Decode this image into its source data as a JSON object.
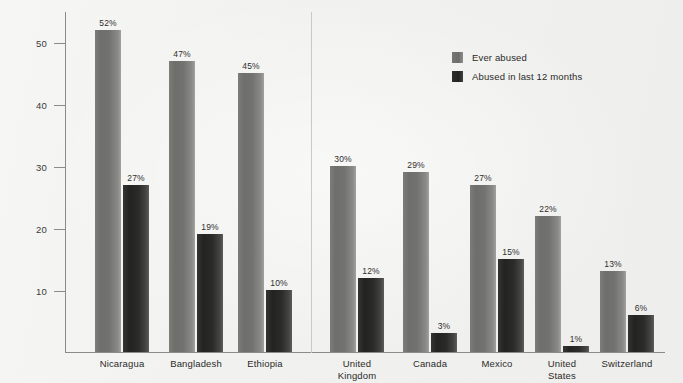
{
  "chart_data": {
    "type": "bar",
    "title": "",
    "xlabel": "",
    "ylabel": "Percentage of women",
    "ylim": [
      0,
      55
    ],
    "yticks": [
      10,
      20,
      30,
      40,
      50
    ],
    "ytick_labels": [
      "10",
      "20",
      "30",
      "40",
      "50"
    ],
    "grid": false,
    "legend_position": "top-right",
    "categories": [
      "Nicaragua",
      "Bangladesh",
      "Ethiopia",
      "United\nKingdom",
      "Canada",
      "Mexico",
      "United\nStates",
      "Switzerland"
    ],
    "series": [
      {
        "name": "Ever abused",
        "color": "#6e6e6b",
        "values": [
          52,
          47,
          45,
          30,
          29,
          27,
          22,
          13
        ],
        "labels": [
          "52%",
          "47%",
          "45%",
          "30%",
          "29%",
          "27%",
          "22%",
          "13%"
        ]
      },
      {
        "name": "Abused in last 12 months",
        "color": "#232321",
        "values": [
          27,
          19,
          10,
          12,
          3,
          15,
          1,
          6
        ],
        "labels": [
          "27%",
          "19%",
          "10%",
          "12%",
          "3%",
          "15%",
          "1%",
          "6%"
        ]
      }
    ],
    "annotations": {
      "group_separator_after_category_index": 2
    }
  },
  "legend": {
    "items": [
      {
        "label": "Ever abused"
      },
      {
        "label": "Abused in last 12 months"
      }
    ]
  },
  "axes": {
    "y_title": "Percentage of women"
  },
  "colors": {
    "background": "#f3f3f1",
    "axis": "#8b8b88",
    "series_ever_abused": "#6e6e6b",
    "series_recent_abuse": "#232321",
    "text": "#2b2b29"
  }
}
